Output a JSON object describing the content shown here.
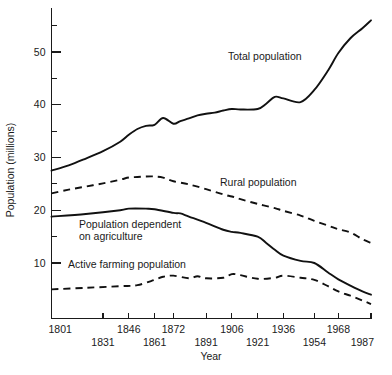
{
  "chart_data": {
    "type": "line",
    "title": "",
    "xlabel": "Year",
    "ylabel": "Population (millions)",
    "xlim": [
      1801,
      1987
    ],
    "ylim": [
      0,
      58
    ],
    "grid": false,
    "legend_position": "inline-annotations",
    "x_tick_labels": [
      "1801",
      "1831",
      "1846",
      "1861",
      "1872",
      "1891",
      "1906",
      "1921",
      "1936",
      "1954",
      "1968",
      "1987"
    ],
    "x_tick_values": [
      1801,
      1831,
      1846,
      1861,
      1872,
      1891,
      1906,
      1921,
      1936,
      1954,
      1968,
      1987
    ],
    "y_tick_labels": [
      "10",
      "20",
      "30",
      "40",
      "50"
    ],
    "y_tick_values": [
      10,
      20,
      30,
      40,
      50
    ],
    "y_minor_ticks": [
      5,
      15,
      25,
      35,
      45,
      55
    ],
    "series": [
      {
        "name": "Total population",
        "style": "solid",
        "label_text": "Total population",
        "x": [
          1801,
          1811,
          1821,
          1831,
          1841,
          1846,
          1851,
          1856,
          1861,
          1866,
          1872,
          1876,
          1881,
          1886,
          1891,
          1896,
          1901,
          1906,
          1911,
          1921,
          1926,
          1931,
          1936,
          1946,
          1954,
          1962,
          1968,
          1975,
          1982,
          1987
        ],
        "values": [
          27.5,
          28.5,
          29.8,
          31.2,
          33.0,
          34.3,
          35.4,
          36.0,
          36.2,
          37.5,
          36.4,
          36.9,
          37.4,
          38.0,
          38.3,
          38.5,
          38.9,
          39.2,
          39.1,
          39.2,
          40.2,
          41.5,
          41.2,
          40.5,
          42.8,
          46.5,
          49.8,
          52.6,
          54.5,
          56.0
        ]
      },
      {
        "name": "Rural population",
        "style": "dashed",
        "label_text": "Rural population",
        "x": [
          1801,
          1811,
          1821,
          1831,
          1841,
          1846,
          1851,
          1856,
          1861,
          1866,
          1872,
          1881,
          1891,
          1901,
          1906,
          1911,
          1921,
          1931,
          1936,
          1946,
          1954,
          1962,
          1968,
          1975,
          1982,
          1987
        ],
        "values": [
          23.2,
          23.9,
          24.5,
          25.1,
          25.8,
          26.2,
          26.3,
          26.4,
          26.4,
          26.2,
          25.5,
          24.9,
          24.0,
          23.0,
          22.6,
          22.1,
          21.2,
          20.4,
          19.9,
          19.0,
          18.0,
          17.1,
          16.4,
          15.8,
          14.5,
          13.8
        ]
      },
      {
        "name": "Population dependent on agriculture",
        "style": "solid",
        "label_text": "Population dependent\non agriculture",
        "x": [
          1801,
          1821,
          1841,
          1846,
          1856,
          1861,
          1872,
          1876,
          1881,
          1891,
          1901,
          1906,
          1911,
          1921,
          1926,
          1931,
          1936,
          1946,
          1954,
          1962,
          1968,
          1975,
          1982,
          1987
        ],
        "values": [
          18.8,
          19.3,
          20.0,
          20.3,
          20.3,
          20.2,
          19.5,
          19.4,
          18.8,
          17.6,
          16.3,
          15.9,
          15.7,
          15.0,
          13.8,
          12.5,
          11.4,
          10.4,
          10.0,
          8.2,
          6.9,
          5.7,
          4.6,
          4.0
        ]
      },
      {
        "name": "Active farming population",
        "style": "dashed",
        "label_text": "Active farming population",
        "x": [
          1801,
          1821,
          1841,
          1851,
          1861,
          1866,
          1872,
          1881,
          1886,
          1891,
          1901,
          1906,
          1911,
          1921,
          1931,
          1936,
          1946,
          1954,
          1962,
          1968,
          1975,
          1982,
          1987
        ],
        "values": [
          5.0,
          5.3,
          5.6,
          5.8,
          6.8,
          7.4,
          7.6,
          7.1,
          7.5,
          7.1,
          7.2,
          7.9,
          7.7,
          7.0,
          7.2,
          7.6,
          7.2,
          6.8,
          5.6,
          4.6,
          3.8,
          2.9,
          2.2
        ]
      }
    ],
    "annotations": [
      {
        "text": "Total population",
        "x_px": 228,
        "y_px": 60
      },
      {
        "text": "Rural population",
        "x_px": 220,
        "y_px": 186
      },
      {
        "text": "Population dependent",
        "x_px": 79,
        "y_px": 228
      },
      {
        "text": "on agriculture",
        "x_px": 79,
        "y_px": 240
      },
      {
        "text": "Active farming population",
        "x_px": 68,
        "y_px": 268
      }
    ],
    "colors": {
      "line": "#111111",
      "axis": "#1a1a1a",
      "background": "#ffffff"
    }
  }
}
